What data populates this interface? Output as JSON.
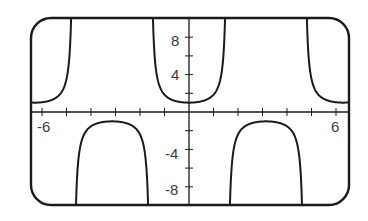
{
  "chart_data": {
    "type": "line",
    "title": "",
    "function": "y = sec(x)",
    "xlabel": "",
    "ylabel": "",
    "xlim": [
      -6.45,
      6.55
    ],
    "ylim": [
      -10,
      10
    ],
    "grid": false,
    "legend": null,
    "x_ticks": [
      -6,
      -5,
      -4,
      -3,
      -2,
      -1,
      1,
      2,
      3,
      4,
      5,
      6
    ],
    "x_tick_labels": [
      {
        "value": -6,
        "label": "-6"
      },
      {
        "value": 6,
        "label": "6"
      }
    ],
    "y_ticks": [
      -8,
      -6,
      -4,
      -2,
      2,
      4,
      6,
      8
    ],
    "y_tick_labels": [
      {
        "value": 8,
        "label": "8"
      },
      {
        "value": 4,
        "label": "4"
      },
      {
        "value": -4,
        "label": "-4"
      },
      {
        "value": -8,
        "label": "-8"
      }
    ],
    "asymptotes_x": [
      -4.712,
      -1.571,
      1.571,
      4.712
    ],
    "series": [
      {
        "name": "sec(x)",
        "x": [
          -6.283,
          -5.5,
          -5.0,
          -4.9,
          -4.8,
          -3.14159,
          -2.0,
          -1.8,
          -1.7,
          -1.6,
          0,
          1.6,
          1.7,
          1.8,
          2.0,
          3.14159,
          4.8,
          4.9,
          5.0,
          5.5,
          6.283
        ],
        "y": [
          1,
          1.41,
          3.53,
          5.39,
          11.4,
          -1,
          -2.4,
          -4.4,
          -7.7,
          -34.2,
          1,
          -34.2,
          -7.7,
          -4.4,
          -2.4,
          -1,
          11.4,
          5.39,
          3.53,
          1.41,
          1
        ]
      }
    ],
    "annotations": []
  },
  "labels": {
    "x_neg6": "-6",
    "x_pos6": "6",
    "y_8": "8",
    "y_4": "4",
    "y_neg4": "-4",
    "y_neg8": "-8"
  }
}
